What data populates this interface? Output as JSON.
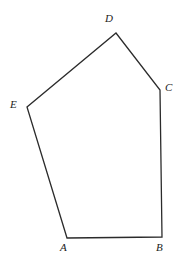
{
  "figure": {
    "kind": "polygon",
    "name": "pentagon-ABCDE",
    "background_color": "#ffffff",
    "stroke_color": "#2b2b2b",
    "stroke_width": 1.3,
    "fill": "none",
    "canvas": {
      "width": 180,
      "height": 263
    },
    "vertices": [
      {
        "id": "A",
        "label": "A",
        "x": 67,
        "y": 238,
        "label_x": 60,
        "label_y": 242
      },
      {
        "id": "B",
        "label": "B",
        "x": 162,
        "y": 237,
        "label_x": 156,
        "label_y": 242
      },
      {
        "id": "C",
        "label": "C",
        "x": 160,
        "y": 90,
        "label_x": 165,
        "label_y": 82
      },
      {
        "id": "D",
        "label": "D",
        "x": 116,
        "y": 33,
        "label_x": 105,
        "label_y": 13
      },
      {
        "id": "E",
        "label": "E",
        "x": 27,
        "y": 107,
        "label_x": 10,
        "label_y": 99
      }
    ],
    "edges": [
      {
        "from": "A",
        "to": "B"
      },
      {
        "from": "B",
        "to": "C"
      },
      {
        "from": "C",
        "to": "D"
      },
      {
        "from": "D",
        "to": "E"
      },
      {
        "from": "E",
        "to": "A"
      }
    ],
    "path": "M 67 238 L 162 237 L 160 90 L 116 33 L 27 107 Z",
    "labels": {
      "A": "A",
      "B": "B",
      "C": "C",
      "D": "D",
      "E": "E"
    }
  }
}
